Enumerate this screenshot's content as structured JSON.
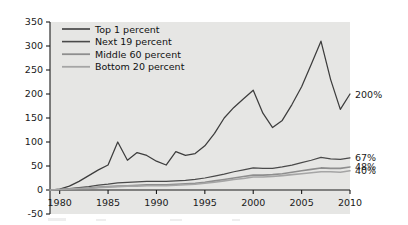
{
  "chart_data": {
    "type": "line",
    "title": "",
    "xlabel": "",
    "ylabel": "Percentage",
    "xlim": [
      1979,
      2010
    ],
    "ylim": [
      -50,
      350
    ],
    "yticks": [
      -50,
      0,
      50,
      100,
      150,
      200,
      250,
      300,
      350
    ],
    "xticks": [
      1980,
      1985,
      1990,
      1995,
      2000,
      2005,
      2010
    ],
    "grid": false,
    "legend_position": "top-left",
    "series": [
      {
        "name": "Top 1 percent",
        "color": "#3d3d3d",
        "end_label": "200%",
        "x": [
          1979,
          1980,
          1981,
          1982,
          1983,
          1984,
          1985,
          1986,
          1987,
          1988,
          1989,
          1990,
          1991,
          1992,
          1993,
          1994,
          1995,
          1996,
          1997,
          1998,
          1999,
          2000,
          2001,
          2002,
          2003,
          2004,
          2005,
          2006,
          2007,
          2008,
          2009,
          2010
        ],
        "values": [
          0,
          2,
          8,
          18,
          30,
          42,
          52,
          100,
          62,
          78,
          72,
          60,
          52,
          80,
          72,
          76,
          92,
          118,
          150,
          172,
          190,
          208,
          160,
          130,
          145,
          178,
          215,
          262,
          310,
          230,
          168,
          200
        ]
      },
      {
        "name": "Next 19 percent",
        "color": "#4a4a4a",
        "end_label": "67%",
        "x": [
          1979,
          1980,
          1981,
          1982,
          1983,
          1984,
          1985,
          1986,
          1987,
          1988,
          1989,
          1990,
          1991,
          1992,
          1993,
          1994,
          1995,
          1996,
          1997,
          1998,
          1999,
          2000,
          2001,
          2002,
          2003,
          2004,
          2005,
          2006,
          2007,
          2008,
          2009,
          2010
        ],
        "values": [
          0,
          1,
          3,
          5,
          7,
          10,
          12,
          15,
          16,
          17,
          18,
          18,
          18,
          19,
          20,
          22,
          25,
          29,
          33,
          38,
          42,
          46,
          45,
          45,
          48,
          52,
          57,
          62,
          68,
          65,
          64,
          67
        ]
      },
      {
        "name": "Middle 60 percent",
        "color": "#8e8e8e",
        "end_label": "48%",
        "x": [
          1979,
          1980,
          1981,
          1982,
          1983,
          1984,
          1985,
          1986,
          1987,
          1988,
          1989,
          1990,
          1991,
          1992,
          1993,
          1994,
          1995,
          1996,
          1997,
          1998,
          1999,
          2000,
          2001,
          2002,
          2003,
          2004,
          2005,
          2006,
          2007,
          2008,
          2009,
          2010
        ],
        "values": [
          0,
          1,
          2,
          3,
          4,
          6,
          7,
          8,
          9,
          10,
          11,
          11,
          11,
          12,
          13,
          14,
          16,
          19,
          22,
          25,
          28,
          31,
          31,
          32,
          34,
          37,
          40,
          43,
          46,
          45,
          45,
          48
        ]
      },
      {
        "name": "Bottom 20 percent",
        "color": "#a5a5a5",
        "end_label": "40%",
        "x": [
          1979,
          1980,
          1981,
          1982,
          1983,
          1984,
          1985,
          1986,
          1987,
          1988,
          1989,
          1990,
          1991,
          1992,
          1993,
          1994,
          1995,
          1996,
          1997,
          1998,
          1999,
          2000,
          2001,
          2002,
          2003,
          2004,
          2005,
          2006,
          2007,
          2008,
          2009,
          2010
        ],
        "values": [
          0,
          1,
          2,
          3,
          3,
          5,
          6,
          7,
          8,
          8,
          9,
          9,
          9,
          10,
          11,
          12,
          14,
          16,
          19,
          22,
          24,
          27,
          27,
          28,
          30,
          32,
          34,
          36,
          38,
          38,
          37,
          40
        ]
      }
    ]
  },
  "axis": {
    "ylabel": "Percentage",
    "ytick_labels": [
      "350",
      "300",
      "250",
      "200",
      "150",
      "100",
      "50",
      "0",
      "-50"
    ],
    "xtick_labels": [
      "1980",
      "1985",
      "1990",
      "1995",
      "2000",
      "2005",
      "2010"
    ]
  },
  "legend": {
    "items": [
      {
        "label": "Top 1 percent",
        "color": "#3d3d3d"
      },
      {
        "label": "Next 19 percent",
        "color": "#4a4a4a"
      },
      {
        "label": "Middle 60 percent",
        "color": "#8e8e8e"
      },
      {
        "label": "Bottom 20 percent",
        "color": "#a5a5a5"
      }
    ]
  },
  "end_labels": [
    {
      "text": "200%",
      "series": "Top 1 percent"
    },
    {
      "text": "67%",
      "series": "Next 19 percent"
    },
    {
      "text": "48%",
      "series": "Middle 60 percent"
    },
    {
      "text": "40%",
      "series": "Bottom 20 percent"
    }
  ]
}
